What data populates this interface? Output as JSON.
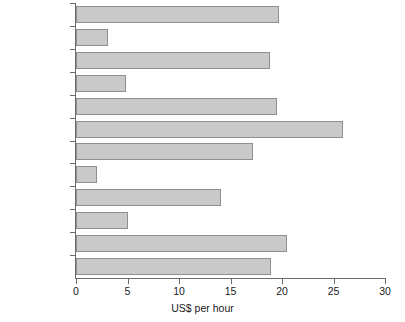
{
  "chart_data": {
    "type": "bar",
    "orientation": "horizontal",
    "title": "",
    "xlabel": "US$ per hour",
    "ylabel": "",
    "xlim": [
      0,
      30
    ],
    "xticks": [
      0,
      5,
      10,
      15,
      20,
      25,
      30
    ],
    "grid": false,
    "legend": null,
    "categories": [
      "Australia",
      "Brazil",
      "Canada",
      "Czech Republic",
      "France",
      "Germany",
      "Japan",
      "Mexico",
      "Spain",
      "Taiwan",
      "UK",
      "US"
    ],
    "values": [
      19.7,
      3.1,
      18.8,
      4.9,
      19.5,
      25.9,
      17.2,
      2.0,
      14.1,
      5.0,
      20.5,
      18.9
    ],
    "bar_fill_color": "#c9c9c9",
    "bar_edge_color": "#8f8f8f",
    "axis_color": "#6b6b6b",
    "text_color": "#1a1a1a"
  },
  "axis": {
    "x_title": "US$ per hour",
    "tick_labels": [
      "0",
      "5",
      "10",
      "15",
      "20",
      "25",
      "30"
    ]
  }
}
